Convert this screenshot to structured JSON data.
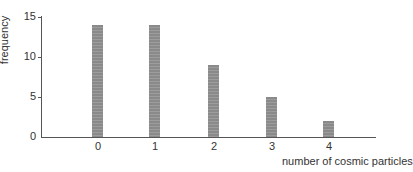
{
  "chart_data": {
    "type": "bar",
    "title": "",
    "xlabel": "number of cosmic particles",
    "ylabel": "frequency",
    "categories": [
      "0",
      "1",
      "2",
      "3",
      "4"
    ],
    "values": [
      14,
      14,
      9,
      5,
      2
    ],
    "ylim": [
      0,
      15
    ],
    "yticks": [
      "0",
      "5",
      "10",
      "15"
    ],
    "grid": false,
    "legend": null
  },
  "colors": {
    "bar": "#8f8f8f",
    "axis": "#555555"
  }
}
